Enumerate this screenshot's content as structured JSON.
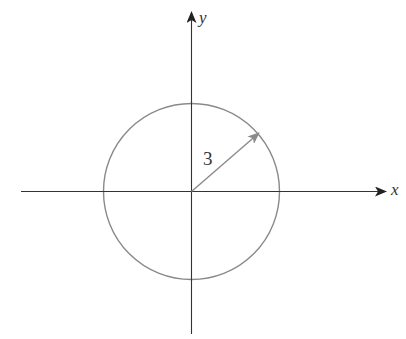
{
  "diagram": {
    "type": "circle-on-axes",
    "axes": {
      "x_label": "x",
      "y_label": "y"
    },
    "circle": {
      "center": [
        0,
        0
      ],
      "radius": 3,
      "radius_label": "3"
    },
    "colors": {
      "axis": "#333333",
      "circle": "#8a8a8a",
      "radius_arrow": "#8a8a8a",
      "text": "#333333"
    }
  }
}
